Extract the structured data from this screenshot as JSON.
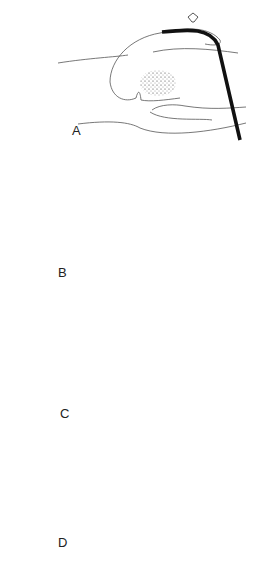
{
  "figure": {
    "panels": [
      {
        "label": "A",
        "content": "Endoscope tip in stomach, arrow pressing from above"
      },
      {
        "label": "B",
        "content": "Hand compressing abdomen, endoscope curving down"
      },
      {
        "label": "C",
        "content": "Hand compressing, endoscope straight vertical"
      },
      {
        "label": "D",
        "content": "Endoscope diagonal from upper left"
      }
    ]
  }
}
